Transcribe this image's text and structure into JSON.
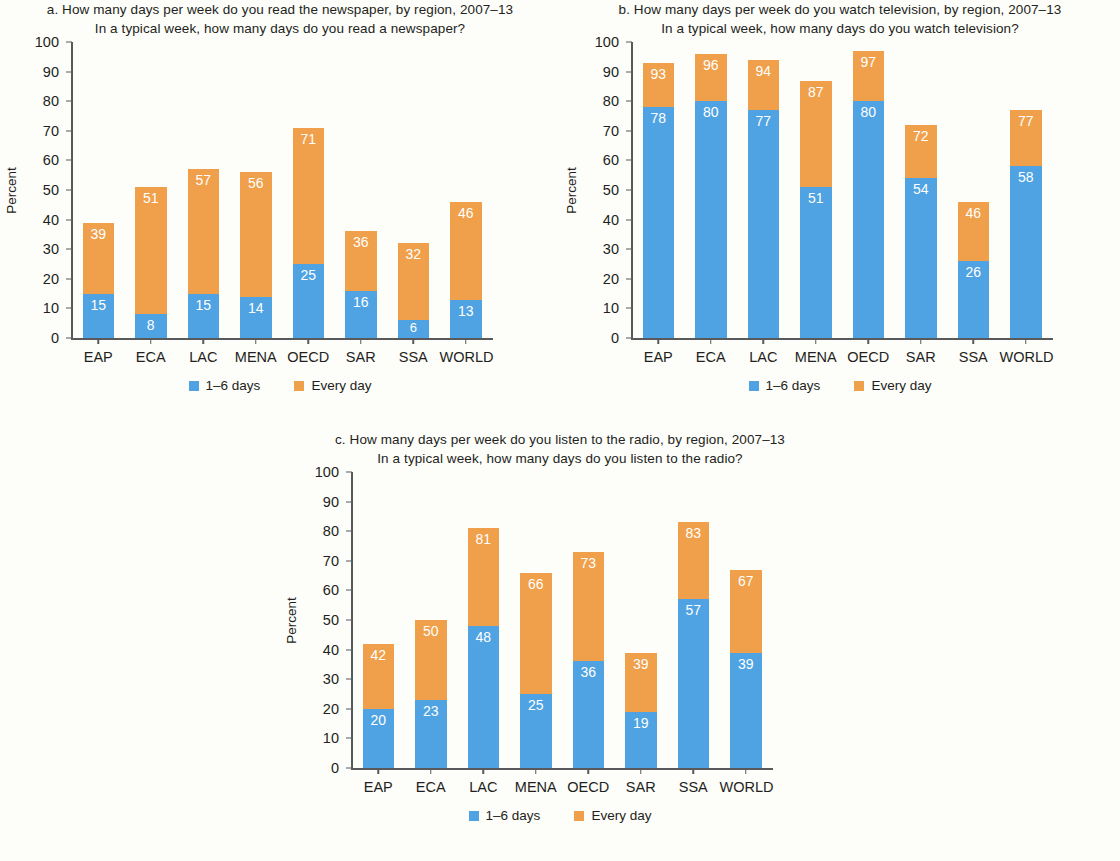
{
  "page": {
    "background": "#fdfdfa",
    "colors": {
      "series_1_6_days": "#4fa3e3",
      "series_every_day": "#f0a04a",
      "axis": "#58595b",
      "text": "#231f20",
      "label_text": "#ffffff"
    }
  },
  "legend": {
    "blue_label": "1–6 days",
    "orange_label": "Every day"
  },
  "panels": {
    "a": {
      "title": "a. How many days per week do you read the newspaper, by region, 2007–13",
      "subtitle": "In a typical week, how many days do you read a newspaper?"
    },
    "b": {
      "title": "b. How many days per week do you watch television, by region, 2007–13",
      "subtitle": "In a typical week, how many days do you watch television?"
    },
    "c": {
      "title": "c. How many days per week do you listen to the radio, by region, 2007–13",
      "subtitle": "In a typical week, how many days do you listen to the radio?"
    }
  },
  "axis": {
    "ylabel": "Percent",
    "yticks": [
      "100",
      "90",
      "80",
      "70",
      "60",
      "50",
      "40",
      "30",
      "20",
      "10",
      "0"
    ]
  },
  "chart_data": [
    {
      "id": "a",
      "type": "bar",
      "stacked": true,
      "title": "a. How many days per week do you read the newspaper, by region, 2007–13",
      "subtitle": "In a typical week, how many days do you read a newspaper?",
      "xlabel": "",
      "ylabel": "Percent",
      "ylim": [
        0,
        100
      ],
      "yticks": [
        0,
        10,
        20,
        30,
        40,
        50,
        60,
        70,
        80,
        90,
        100
      ],
      "grid": false,
      "legend_position": "bottom",
      "categories": [
        "EAP",
        "ECA",
        "LAC",
        "MENA",
        "OECD",
        "SAR",
        "SSA",
        "WORLD"
      ],
      "series": [
        {
          "name": "1–6 days",
          "color": "#4fa3e3",
          "values": [
            15,
            8,
            15,
            14,
            25,
            16,
            6,
            13
          ]
        },
        {
          "name": "Every day",
          "color": "#f0a04a",
          "values": [
            24,
            43,
            42,
            42,
            46,
            20,
            26,
            33
          ]
        }
      ],
      "totals": [
        39,
        51,
        57,
        56,
        71,
        36,
        32,
        46
      ],
      "data_labels": {
        "bottom_segment": [
          "15",
          "8",
          "15",
          "14",
          "25",
          "16",
          "6",
          "13"
        ],
        "top_of_bar_total": [
          "39",
          "51",
          "57",
          "56",
          "71",
          "36",
          "32",
          "46"
        ]
      }
    },
    {
      "id": "b",
      "type": "bar",
      "stacked": true,
      "title": "b. How many days per week do you watch television, by region, 2007–13",
      "subtitle": "In a typical week, how many days do you watch television?",
      "xlabel": "",
      "ylabel": "Percent",
      "ylim": [
        0,
        100
      ],
      "yticks": [
        0,
        10,
        20,
        30,
        40,
        50,
        60,
        70,
        80,
        90,
        100
      ],
      "grid": false,
      "legend_position": "bottom",
      "categories": [
        "EAP",
        "ECA",
        "LAC",
        "MENA",
        "OECD",
        "SAR",
        "SSA",
        "WORLD"
      ],
      "series": [
        {
          "name": "1–6 days",
          "color": "#4fa3e3",
          "values": [
            78,
            80,
            77,
            51,
            80,
            54,
            26,
            58
          ]
        },
        {
          "name": "Every day",
          "color": "#f0a04a",
          "values": [
            15,
            16,
            17,
            36,
            17,
            18,
            20,
            19
          ]
        }
      ],
      "totals": [
        93,
        96,
        94,
        87,
        97,
        72,
        46,
        77
      ],
      "data_labels": {
        "bottom_segment": [
          "78",
          "80",
          "77",
          "51",
          "80",
          "54",
          "26",
          "58"
        ],
        "top_of_bar_total": [
          "93",
          "96",
          "94",
          "87",
          "97",
          "72",
          "46",
          "77"
        ]
      }
    },
    {
      "id": "c",
      "type": "bar",
      "stacked": true,
      "title": "c. How many days per week do you listen to the radio, by region, 2007–13",
      "subtitle": "In a typical week, how many days do you listen to the radio?",
      "xlabel": "",
      "ylabel": "Percent",
      "ylim": [
        0,
        100
      ],
      "yticks": [
        0,
        10,
        20,
        30,
        40,
        50,
        60,
        70,
        80,
        90,
        100
      ],
      "grid": false,
      "legend_position": "bottom",
      "categories": [
        "EAP",
        "ECA",
        "LAC",
        "MENA",
        "OECD",
        "SAR",
        "SSA",
        "WORLD"
      ],
      "series": [
        {
          "name": "1–6 days",
          "color": "#4fa3e3",
          "values": [
            20,
            23,
            48,
            25,
            36,
            19,
            57,
            39
          ]
        },
        {
          "name": "Every day",
          "color": "#f0a04a",
          "values": [
            22,
            27,
            33,
            41,
            37,
            20,
            26,
            28
          ]
        }
      ],
      "totals": [
        42,
        50,
        81,
        66,
        73,
        39,
        83,
        67
      ],
      "data_labels": {
        "bottom_segment": [
          "20",
          "23",
          "48",
          "25",
          "36",
          "19",
          "57",
          "39"
        ],
        "top_of_bar_total": [
          "42",
          "50",
          "81",
          "66",
          "73",
          "39",
          "83",
          "67"
        ]
      }
    }
  ]
}
